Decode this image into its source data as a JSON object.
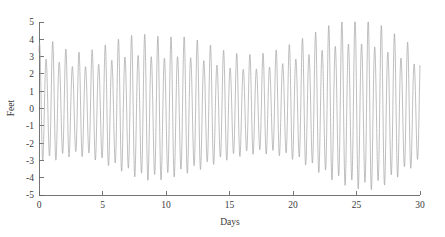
{
  "chart_data": {
    "type": "line",
    "title": "",
    "subtitle": "",
    "xlabel": "Days",
    "ylabel": "Feet",
    "xlim": [
      0,
      30
    ],
    "ylim": [
      -5,
      5
    ],
    "grid": false,
    "legend": null,
    "xticks": [
      0,
      5,
      10,
      15,
      20,
      25,
      30
    ],
    "xtick_labels": [
      "0",
      "5",
      "10",
      "15",
      "20",
      "25",
      "30"
    ],
    "yticks": [
      -5,
      -4,
      -3,
      -2,
      -1,
      0,
      1,
      2,
      3,
      4,
      5
    ],
    "ytick_labels": [
      "-5",
      "-4",
      "-3",
      "-2",
      "-1",
      "0",
      "1",
      "2",
      "3",
      "4",
      "5"
    ],
    "line_color": "#9a9a9a",
    "axis_color": "#666666",
    "background_color": "#ffffff",
    "series": [
      {
        "name": "Tide height",
        "semidiurnal_period_days": 0.5175,
        "cycles_per_day": 1.9323,
        "spring_neap_period_days": 14.77,
        "mean_level_feet": -0.1,
        "amplitude_envelope_feet": {
          "days": [
            0,
            1,
            2,
            3,
            4,
            5,
            6,
            7,
            8,
            9,
            10,
            11,
            12,
            13,
            14,
            15,
            16,
            17,
            18,
            19,
            20,
            21,
            22,
            23,
            24,
            25,
            26,
            27,
            28,
            29,
            30
          ],
          "max_feet": [
            3.3,
            3.4,
            3.0,
            2.8,
            2.9,
            3.1,
            3.4,
            3.6,
            3.7,
            3.6,
            3.5,
            3.6,
            3.5,
            3.3,
            3.0,
            2.8,
            2.7,
            2.7,
            2.8,
            3.0,
            3.3,
            3.6,
            3.9,
            4.2,
            4.4,
            4.5,
            4.4,
            4.1,
            3.7,
            3.3,
            2.9
          ],
          "min_feet": [
            -2.8,
            -2.9,
            -2.7,
            -2.6,
            -2.7,
            -3.0,
            -3.3,
            -3.6,
            -3.9,
            -4.0,
            -3.9,
            -3.7,
            -3.5,
            -3.3,
            -3.0,
            -2.8,
            -2.6,
            -2.5,
            -2.5,
            -2.6,
            -2.8,
            -3.1,
            -3.5,
            -3.9,
            -4.2,
            -4.4,
            -4.5,
            -4.3,
            -3.9,
            -3.4,
            -3.0
          ]
        },
        "notes": "Alternating high/low peak heights indicate diurnal inequality; largest ranges near day 25 (spring tide), smallest near days 3-4 and 16-18 (neap tides)"
      }
    ]
  },
  "axes": {
    "y_axis_title": "Feet",
    "x_axis_title": "Days"
  }
}
